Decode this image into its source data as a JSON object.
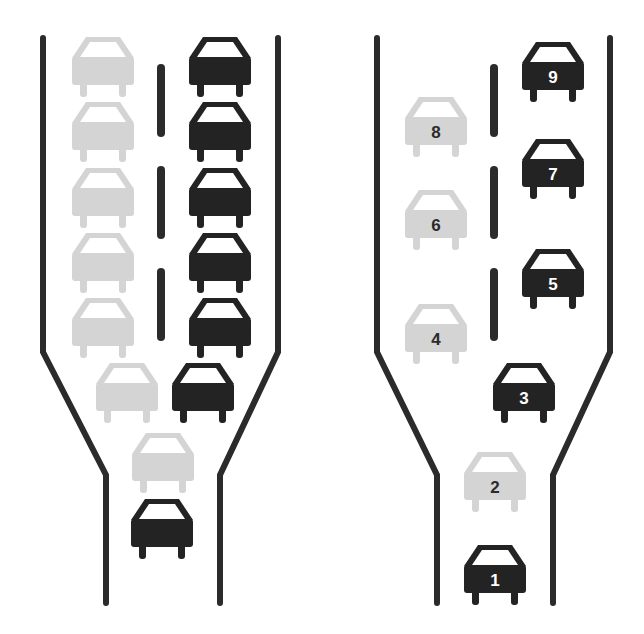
{
  "colors": {
    "background": "#ffffff",
    "road": "#2b2b2b",
    "dark_car": "#232323",
    "light_car": "#d4d4d4",
    "windshield": "#ffffff",
    "dark_car_label": "#ffffff",
    "light_car_label": "#2b2b2b"
  },
  "car_size": {
    "width": 62,
    "height": 60
  },
  "panels": [
    {
      "id": "left",
      "caption": "Without zipper merge",
      "road_edges": [
        [
          [
            43,
            38
          ],
          [
            43,
            352
          ],
          [
            106,
            475
          ],
          [
            106,
            603
          ]
        ],
        [
          [
            278,
            38
          ],
          [
            278,
            352
          ],
          [
            220,
            475
          ],
          [
            220,
            603
          ]
        ]
      ],
      "dashes": [
        [
          [
            161,
            68
          ],
          [
            161,
            133
          ]
        ],
        [
          [
            161,
            170
          ],
          [
            161,
            235
          ]
        ],
        [
          [
            161,
            272
          ],
          [
            161,
            337
          ]
        ]
      ],
      "cars": [
        {
          "x": 72,
          "y": 37,
          "tone": "light",
          "label": ""
        },
        {
          "x": 72,
          "y": 102,
          "tone": "light",
          "label": ""
        },
        {
          "x": 72,
          "y": 168,
          "tone": "light",
          "label": ""
        },
        {
          "x": 72,
          "y": 233,
          "tone": "light",
          "label": ""
        },
        {
          "x": 72,
          "y": 298,
          "tone": "light",
          "label": ""
        },
        {
          "x": 96,
          "y": 363,
          "tone": "light",
          "label": ""
        },
        {
          "x": 132,
          "y": 433,
          "tone": "light",
          "label": ""
        },
        {
          "x": 189,
          "y": 37,
          "tone": "dark",
          "label": ""
        },
        {
          "x": 189,
          "y": 102,
          "tone": "dark",
          "label": ""
        },
        {
          "x": 189,
          "y": 168,
          "tone": "dark",
          "label": ""
        },
        {
          "x": 189,
          "y": 233,
          "tone": "dark",
          "label": ""
        },
        {
          "x": 189,
          "y": 298,
          "tone": "dark",
          "label": ""
        },
        {
          "x": 172,
          "y": 363,
          "tone": "dark",
          "label": ""
        },
        {
          "x": 131,
          "y": 499,
          "tone": "dark",
          "label": ""
        }
      ]
    },
    {
      "id": "right",
      "caption": "With zipper merge",
      "road_edges": [
        [
          [
            377,
            38
          ],
          [
            377,
            352
          ],
          [
            437,
            475
          ],
          [
            437,
            603
          ]
        ],
        [
          [
            610,
            38
          ],
          [
            610,
            352
          ],
          [
            553,
            475
          ],
          [
            553,
            603
          ]
        ]
      ],
      "dashes": [
        [
          [
            494,
            68
          ],
          [
            494,
            133
          ]
        ],
        [
          [
            494,
            170
          ],
          [
            494,
            235
          ]
        ],
        [
          [
            494,
            272
          ],
          [
            494,
            337
          ]
        ]
      ],
      "cars": [
        {
          "x": 522,
          "y": 42,
          "tone": "dark",
          "label": "9"
        },
        {
          "x": 405,
          "y": 97,
          "tone": "light",
          "label": "8"
        },
        {
          "x": 522,
          "y": 139,
          "tone": "dark",
          "label": "7"
        },
        {
          "x": 405,
          "y": 190,
          "tone": "light",
          "label": "6"
        },
        {
          "x": 522,
          "y": 249,
          "tone": "dark",
          "label": "5"
        },
        {
          "x": 405,
          "y": 304,
          "tone": "light",
          "label": "4"
        },
        {
          "x": 493,
          "y": 363,
          "tone": "dark",
          "label": "3"
        },
        {
          "x": 464,
          "y": 452,
          "tone": "light",
          "label": "2"
        },
        {
          "x": 464,
          "y": 545,
          "tone": "dark",
          "label": "1"
        }
      ]
    }
  ]
}
